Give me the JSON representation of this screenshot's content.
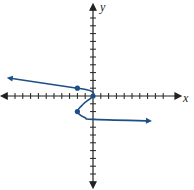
{
  "chart_data": {
    "type": "line",
    "title": "",
    "xlabel": "x",
    "ylabel": "y",
    "xlim": [
      -11,
      10
    ],
    "ylim": [
      -11,
      11
    ],
    "grid": false,
    "legend": null,
    "tick_spacing": 1,
    "tick_labels": false,
    "series": [
      {
        "name": "curve",
        "color": "#1d4f86",
        "orientation": "x as function of y (sideways)",
        "points": [
          {
            "x": -10.8,
            "y": 2.3,
            "arrow": true
          },
          {
            "x": -2,
            "y": 1,
            "marked": true
          },
          {
            "x": -0.2,
            "y": 0.6
          },
          {
            "x": 0,
            "y": 0,
            "marked": true
          },
          {
            "x": -1.2,
            "y": -1
          },
          {
            "x": -2,
            "y": -2,
            "marked": true
          },
          {
            "x": -1,
            "y": -2.8
          },
          {
            "x": 0,
            "y": -3
          },
          {
            "x": 7.3,
            "y": -3.2,
            "arrow": true
          }
        ]
      }
    ],
    "marked_points": [
      {
        "x": -2,
        "y": 1
      },
      {
        "x": 0,
        "y": 0
      },
      {
        "x": -2,
        "y": -2
      }
    ]
  },
  "labels": {
    "x": "x",
    "y": "y"
  },
  "colors": {
    "curve": "#1d4f86",
    "axis": "#222222"
  }
}
